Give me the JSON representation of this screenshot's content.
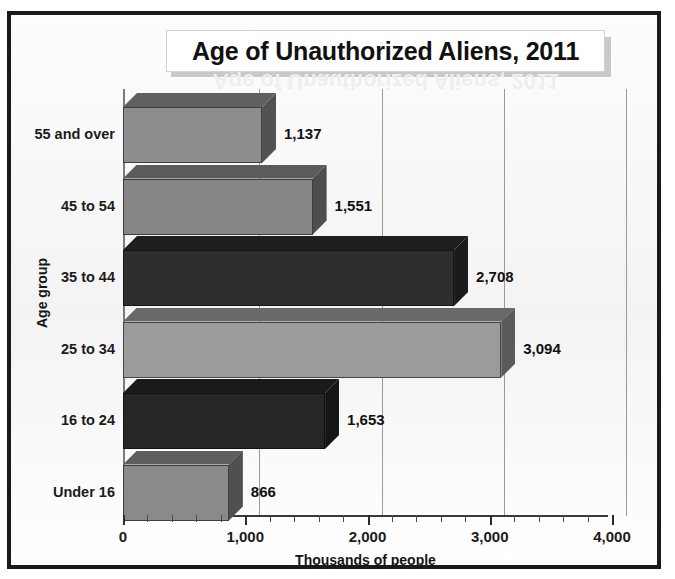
{
  "chart_data": {
    "type": "bar",
    "orientation": "horizontal",
    "title": "Age of Unauthorized Aliens, 2011",
    "xlabel": "Thousands of people",
    "ylabel": "Age group",
    "categories": [
      "Under 16",
      "16 to 24",
      "25 to 34",
      "35 to 44",
      "45 to 54",
      "55 and over"
    ],
    "values": [
      866,
      1653,
      3094,
      2708,
      1551,
      1137
    ],
    "value_labels": [
      "866",
      "1,653",
      "3,094",
      "2,708",
      "1,551",
      "1,137"
    ],
    "xlim": [
      0,
      4000
    ],
    "xticks": [
      0,
      1000,
      2000,
      3000,
      4000
    ],
    "xtick_labels": [
      "0",
      "1,000",
      "2,000",
      "3,000",
      "4,000"
    ],
    "minor_tick_step": 200,
    "grid": "vertical-major",
    "legend": "none",
    "series": [
      {
        "name": "Thousands of people",
        "points": [
          {
            "category": "55 and over",
            "value": 1137,
            "label": "1,137",
            "color": "#8d8d8d"
          },
          {
            "category": "45 to 54",
            "value": 1551,
            "label": "1,551",
            "color": "#868686"
          },
          {
            "category": "35 to 44",
            "value": 2708,
            "label": "2,708",
            "color": "#2e2e2e"
          },
          {
            "category": "25 to 34",
            "value": 3094,
            "label": "3,094",
            "color": "#9b9b9b"
          },
          {
            "category": "16 to 24",
            "value": 1653,
            "label": "1,653",
            "color": "#262626"
          },
          {
            "category": "Under 16",
            "value": 866,
            "label": "866",
            "color": "#8a8a8a"
          }
        ]
      }
    ]
  },
  "colors": {
    "frame_border": "#1a1a1a",
    "plot_background": "#f7f7f7",
    "gridline": "#9a9a9a",
    "axis": "#2c2c2c",
    "text": "#111111",
    "bar_light": "#8d8d8d",
    "bar_lightest": "#9b9b9b",
    "bar_dark": "#2e2e2e"
  },
  "rows": [
    {
      "label": "55 and over",
      "value_label": "1,137"
    },
    {
      "label": "45 to 54",
      "value_label": "1,551"
    },
    {
      "label": "35 to 44",
      "value_label": "2,708"
    },
    {
      "label": "25 to 34",
      "value_label": "3,094"
    },
    {
      "label": "16 to 24",
      "value_label": "1,653"
    },
    {
      "label": "Under 16",
      "value_label": "866"
    }
  ],
  "xticks": [
    {
      "label": "0"
    },
    {
      "label": "1,000"
    },
    {
      "label": "2,000"
    },
    {
      "label": "3,000"
    },
    {
      "label": "4,000"
    }
  ]
}
